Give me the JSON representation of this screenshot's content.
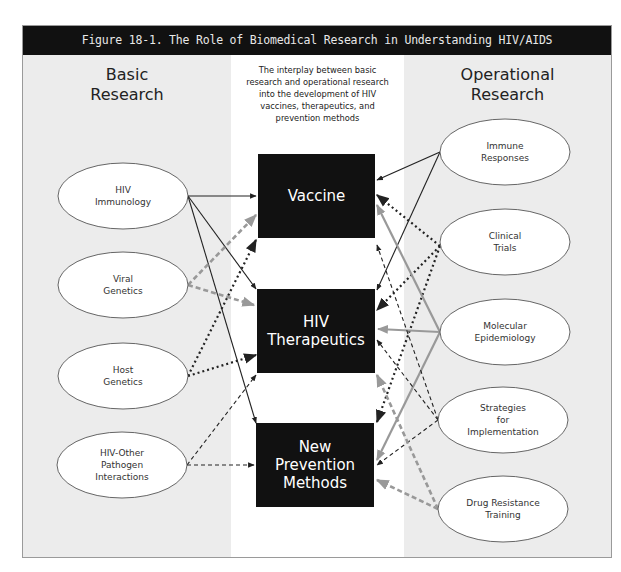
{
  "figure": {
    "title": "Figure 18-1.  The Role of Biomedical Research in Understanding HIV/AIDS",
    "left_heading": [
      "Basic",
      "Research"
    ],
    "right_heading": [
      "Operational",
      "Research"
    ],
    "intro": [
      "The interplay between basic",
      "research and operational research",
      "into the development of HIV",
      "vaccines, therapeutics, and",
      "prevention methods"
    ]
  },
  "basic_research_nodes": [
    {
      "id": "hiv-immunology",
      "lines": [
        "HIV",
        "Immunology"
      ]
    },
    {
      "id": "viral-genetics",
      "lines": [
        "Viral",
        "Genetics"
      ]
    },
    {
      "id": "host-genetics",
      "lines": [
        "Host",
        "Genetics"
      ]
    },
    {
      "id": "hiv-other-pathogen",
      "lines": [
        "HIV-Other",
        "Pathogen",
        "Interactions"
      ]
    }
  ],
  "outcome_boxes": [
    {
      "id": "vaccine",
      "lines": [
        "Vaccine"
      ]
    },
    {
      "id": "hiv-therapeutics",
      "lines": [
        "HIV",
        "Therapeutics"
      ]
    },
    {
      "id": "new-prevention-methods",
      "lines": [
        "New",
        "Prevention",
        "Methods"
      ]
    }
  ],
  "operational_research_nodes": [
    {
      "id": "immune-responses",
      "lines": [
        "Immune",
        "Responses"
      ]
    },
    {
      "id": "clinical-trials",
      "lines": [
        "Clinical",
        "Trials"
      ]
    },
    {
      "id": "molecular-epidemiology",
      "lines": [
        "Molecular",
        "Epidemiology"
      ]
    },
    {
      "id": "strategies-implementation",
      "lines": [
        "Strategies",
        "for",
        "Implementation"
      ]
    },
    {
      "id": "drug-resistance-training",
      "lines": [
        "Drug Resistance",
        "Training"
      ]
    }
  ],
  "edge_styles": {
    "solid": "#222222",
    "dotted": "#222222",
    "dashed": "#222222",
    "gray_solid": "#999999",
    "gray_dashed": "#999999"
  },
  "edges": [
    {
      "from": "hiv-immunology",
      "to": "vaccine",
      "style": "solid"
    },
    {
      "from": "hiv-immunology",
      "to": "hiv-therapeutics",
      "style": "solid"
    },
    {
      "from": "hiv-immunology",
      "to": "new-prevention-methods",
      "style": "solid"
    },
    {
      "from": "viral-genetics",
      "to": "vaccine",
      "style": "gray_dashed"
    },
    {
      "from": "viral-genetics",
      "to": "hiv-therapeutics",
      "style": "gray_dashed"
    },
    {
      "from": "host-genetics",
      "to": "vaccine",
      "style": "dotted"
    },
    {
      "from": "host-genetics",
      "to": "hiv-therapeutics",
      "style": "dotted"
    },
    {
      "from": "hiv-other-pathogen",
      "to": "hiv-therapeutics",
      "style": "dashed"
    },
    {
      "from": "hiv-other-pathogen",
      "to": "new-prevention-methods",
      "style": "dashed"
    },
    {
      "from": "immune-responses",
      "to": "vaccine",
      "style": "solid"
    },
    {
      "from": "immune-responses",
      "to": "hiv-therapeutics",
      "style": "solid"
    },
    {
      "from": "clinical-trials",
      "to": "vaccine",
      "style": "dotted"
    },
    {
      "from": "clinical-trials",
      "to": "hiv-therapeutics",
      "style": "dotted"
    },
    {
      "from": "clinical-trials",
      "to": "new-prevention-methods",
      "style": "dotted"
    },
    {
      "from": "molecular-epidemiology",
      "to": "vaccine",
      "style": "gray_solid"
    },
    {
      "from": "molecular-epidemiology",
      "to": "hiv-therapeutics",
      "style": "gray_solid"
    },
    {
      "from": "molecular-epidemiology",
      "to": "new-prevention-methods",
      "style": "gray_solid"
    },
    {
      "from": "strategies-implementation",
      "to": "vaccine",
      "style": "dashed"
    },
    {
      "from": "strategies-implementation",
      "to": "hiv-therapeutics",
      "style": "dashed"
    },
    {
      "from": "strategies-implementation",
      "to": "new-prevention-methods",
      "style": "dashed"
    },
    {
      "from": "drug-resistance-training",
      "to": "hiv-therapeutics",
      "style": "gray_dashed"
    },
    {
      "from": "drug-resistance-training",
      "to": "new-prevention-methods",
      "style": "gray_dashed"
    }
  ]
}
